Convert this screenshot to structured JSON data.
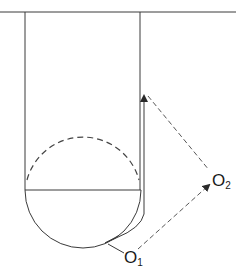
{
  "diagram": {
    "type": "geometric-construction",
    "labels": {
      "o1": {
        "main": "O",
        "sub": "1"
      },
      "o2": {
        "main": "O",
        "sub": "2"
      }
    },
    "colors": {
      "stroke": "#3a3a3a",
      "dashed": "#444444",
      "background": "#ffffff"
    },
    "elements": [
      "top horizontal line",
      "left vertical wall",
      "right vertical wall",
      "horizontal chord",
      "solid lower semicircle",
      "dashed upper arc",
      "inner offset path with arrow",
      "dashed line to O2",
      "dashed arrow from O1 to O2"
    ]
  }
}
